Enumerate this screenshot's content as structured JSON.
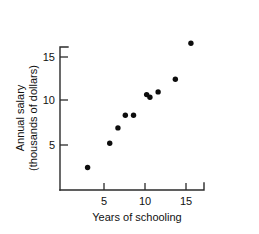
{
  "chart_data": {
    "type": "scatter",
    "title": "",
    "xlabel": "Years of schooling",
    "ylabel": "Annual salary\n(thousands of dollars)",
    "ylabel_line1": "Annual salary",
    "ylabel_line2": "(thousands of dollars)",
    "xlim": [
      0,
      18
    ],
    "ylim": [
      0,
      18
    ],
    "xticks": [
      5,
      10,
      15
    ],
    "xtick_labels": [
      "5",
      "10",
      "15"
    ],
    "yticks": [
      5,
      10,
      15
    ],
    "ytick_labels": [
      "5",
      "10",
      "15"
    ],
    "grid": false,
    "legend": null,
    "marker": "filled-circle",
    "marker_color": "#0d0d0d",
    "axis_color": "#2b2b2b",
    "points": [
      {
        "x": 3.0,
        "y": 2.5
      },
      {
        "x": 5.7,
        "y": 5.2
      },
      {
        "x": 6.7,
        "y": 6.9
      },
      {
        "x": 7.6,
        "y": 8.3
      },
      {
        "x": 8.6,
        "y": 8.3
      },
      {
        "x": 10.2,
        "y": 10.6
      },
      {
        "x": 10.6,
        "y": 10.3
      },
      {
        "x": 11.6,
        "y": 10.9
      },
      {
        "x": 13.7,
        "y": 12.3
      },
      {
        "x": 15.6,
        "y": 16.3
      }
    ],
    "series": [
      {
        "name": "salary vs schooling",
        "x": [
          3.0,
          5.7,
          6.7,
          7.6,
          8.6,
          10.2,
          10.6,
          11.6,
          13.7,
          15.6
        ],
        "values": [
          2.5,
          5.2,
          6.9,
          8.3,
          8.3,
          10.6,
          10.3,
          10.9,
          12.3,
          16.3
        ]
      }
    ]
  }
}
